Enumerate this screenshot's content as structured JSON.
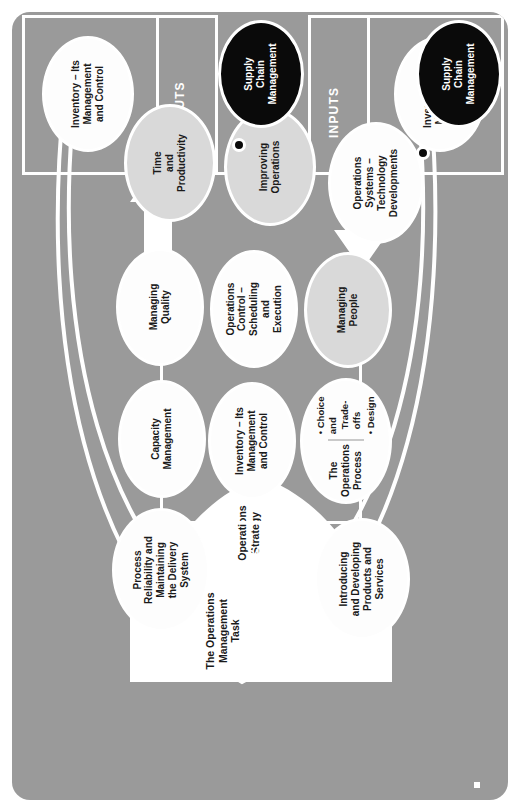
{
  "figure": {
    "orientation": "rotated-90-ccw",
    "colors": {
      "panel_background": "#9a9a9a",
      "line": "#ffffff",
      "circle_white": "#fdfdfd",
      "circle_tint": "#d9d9d9",
      "circle_black": "#0a0a0a",
      "text_dark": "#1a1a1a",
      "text_light": "#ffffff"
    }
  },
  "stage_labels": {
    "inputs": "INPUTS",
    "operations_process": "OPERATIONS PROCESS",
    "outputs": "OUTPUTS"
  },
  "funnel": {
    "task_label": "The Operations\nManagement Task",
    "task_line1": "The Operations",
    "task_line2": "Management Task",
    "strategy_line1": "Operations",
    "strategy_line2": "Strategy"
  },
  "inputs_box": {
    "circle": {
      "line1": "Inventory – Its",
      "line2": "Management",
      "line3": "and Control"
    }
  },
  "outputs_box": {
    "circle": {
      "line1": "Inventory – Its",
      "line2": "Management",
      "line3": "and Control"
    }
  },
  "supply_chain_inputs": {
    "line1": "Supply",
    "line2": "Chain",
    "line3": "Management"
  },
  "supply_chain_outputs": {
    "line1": "Supply",
    "line2": "Chain",
    "line3": "Management"
  },
  "process_circles": [
    {
      "id": "introducing-developing",
      "style": "white",
      "lines": [
        "Introducing",
        "and Developing",
        "Products and",
        "Services"
      ]
    },
    {
      "id": "process-reliability",
      "style": "white",
      "lines": [
        "Process",
        "Reliability and",
        "Maintaining",
        "the Delivery",
        "System"
      ]
    },
    {
      "id": "operations-process",
      "style": "white",
      "lines": [
        "The",
        "Operations",
        "Process"
      ],
      "bullets": [
        "Choice and Trade-offs",
        "Design"
      ]
    },
    {
      "id": "inventory-management",
      "style": "white",
      "lines": [
        "Inventory – Its",
        "Management",
        "and Control"
      ]
    },
    {
      "id": "capacity-management",
      "style": "white",
      "lines": [
        "Capacity",
        "Management"
      ]
    },
    {
      "id": "managing-people",
      "style": "tint",
      "lines": [
        "Managing",
        "People"
      ]
    },
    {
      "id": "operations-control",
      "style": "white",
      "lines": [
        "Operations",
        "Control –",
        "Scheduling",
        "and",
        "Execution"
      ]
    },
    {
      "id": "managing-quality",
      "style": "white",
      "lines": [
        "Managing",
        "Quality"
      ]
    },
    {
      "id": "operations-systems",
      "style": "white",
      "lines": [
        "Operations",
        "Systems –",
        "Technology",
        "Developments"
      ]
    },
    {
      "id": "improving-operations",
      "style": "tint",
      "lines": [
        "Improving",
        "Operations"
      ]
    },
    {
      "id": "time-productivity",
      "style": "tint",
      "lines": [
        "Time",
        "and",
        "Productivity"
      ]
    }
  ],
  "bullets": {
    "choice_tradeoffs_line1": "• Choice and",
    "choice_tradeoffs_line2": "Trade-offs",
    "design": "• Design"
  }
}
